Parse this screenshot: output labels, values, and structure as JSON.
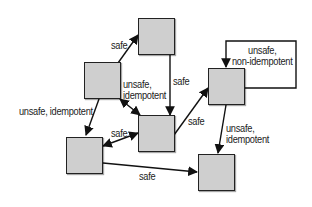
{
  "diagram": {
    "type": "state-transition",
    "colors": {
      "node_fill": "#cfcfcf",
      "node_border": "#222222",
      "edge": "#111111",
      "text": "#222222",
      "background": "#ffffff"
    },
    "nodes": [
      {
        "id": "A",
        "x": 138,
        "y": 18,
        "w": 37,
        "h": 37
      },
      {
        "id": "B",
        "x": 84,
        "y": 62,
        "w": 37,
        "h": 37
      },
      {
        "id": "C",
        "x": 138,
        "y": 115,
        "w": 37,
        "h": 37
      },
      {
        "id": "D",
        "x": 208,
        "y": 68,
        "w": 37,
        "h": 37
      },
      {
        "id": "E",
        "x": 66,
        "y": 137,
        "w": 37,
        "h": 37
      },
      {
        "id": "F",
        "x": 198,
        "y": 154,
        "w": 37,
        "h": 37
      }
    ],
    "edges": [
      {
        "from": "B",
        "to": "A",
        "label": "safe",
        "bidirectional": false
      },
      {
        "from": "A",
        "to": "C",
        "label": "safe",
        "bidirectional": false
      },
      {
        "from": "B",
        "to": "C",
        "label": "unsafe,\nidempotent",
        "bidirectional": true
      },
      {
        "from": "B",
        "to": "E",
        "label": "unsafe, idempotent",
        "bidirectional": false
      },
      {
        "from": "E",
        "to": "C",
        "label": "safe",
        "bidirectional": true
      },
      {
        "from": "C",
        "to": "D",
        "label": "safe",
        "bidirectional": false
      },
      {
        "from": "D",
        "to": "D",
        "label": "unsafe,\nnon-idempotent",
        "bidirectional": false
      },
      {
        "from": "D",
        "to": "F",
        "label": "unsafe,\nidempotent",
        "bidirectional": false
      },
      {
        "from": "E",
        "to": "F",
        "label": "safe",
        "bidirectional": false
      }
    ]
  },
  "labels": {
    "b_to_a": "safe",
    "a_to_c": "safe",
    "b_c": "unsafe,\nidempotent",
    "b_to_e": "unsafe, idempotent",
    "e_c": "safe",
    "c_to_d": "safe",
    "d_self": "unsafe,\nnon-idempotent",
    "d_to_f": "unsafe,\nidempotent",
    "e_to_f": "safe"
  }
}
